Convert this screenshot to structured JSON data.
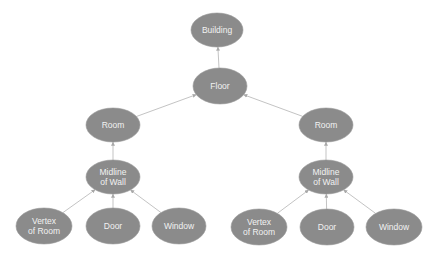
{
  "diagram": {
    "type": "hierarchy tree",
    "colors": {
      "node_fill": "#8b8b8b",
      "node_text": "#f2f2f2",
      "edge": "#b4b4b4",
      "background": "#ffffff"
    },
    "nodes": [
      {
        "id": "building",
        "lines": [
          "Building"
        ],
        "cx": 217,
        "cy": 30,
        "rx": 26,
        "ry": 17
      },
      {
        "id": "floor",
        "lines": [
          "Floor"
        ],
        "cx": 220,
        "cy": 86,
        "rx": 27,
        "ry": 18
      },
      {
        "id": "room_left",
        "lines": [
          "Room"
        ],
        "cx": 113,
        "cy": 125,
        "rx": 27,
        "ry": 17
      },
      {
        "id": "room_right",
        "lines": [
          "Room"
        ],
        "cx": 326,
        "cy": 125,
        "rx": 27,
        "ry": 17
      },
      {
        "id": "midline_left",
        "lines": [
          "Midline",
          "of Wall"
        ],
        "cx": 113,
        "cy": 177,
        "rx": 27,
        "ry": 17
      },
      {
        "id": "midline_right",
        "lines": [
          "Midline",
          "of Wall"
        ],
        "cx": 326,
        "cy": 177,
        "rx": 27,
        "ry": 17
      },
      {
        "id": "vertex_left",
        "lines": [
          "Vertex",
          "of Room"
        ],
        "cx": 44,
        "cy": 226,
        "rx": 28,
        "ry": 18
      },
      {
        "id": "door_left",
        "lines": [
          "Door"
        ],
        "cx": 113,
        "cy": 226,
        "rx": 27,
        "ry": 18
      },
      {
        "id": "window_left",
        "lines": [
          "Window"
        ],
        "cx": 179,
        "cy": 226,
        "rx": 27,
        "ry": 18
      },
      {
        "id": "vertex_right",
        "lines": [
          "Vertex",
          "of Room"
        ],
        "cx": 259,
        "cy": 227,
        "rx": 28,
        "ry": 18
      },
      {
        "id": "door_right",
        "lines": [
          "Door"
        ],
        "cx": 327,
        "cy": 227,
        "rx": 27,
        "ry": 18
      },
      {
        "id": "window_right",
        "lines": [
          "Window"
        ],
        "cx": 394,
        "cy": 227,
        "rx": 28,
        "ry": 18
      }
    ],
    "edges": [
      {
        "from": "floor",
        "to": "building"
      },
      {
        "from": "room_left",
        "to": "floor"
      },
      {
        "from": "room_right",
        "to": "floor"
      },
      {
        "from": "midline_left",
        "to": "room_left"
      },
      {
        "from": "midline_right",
        "to": "room_right"
      },
      {
        "from": "vertex_left",
        "to": "midline_left"
      },
      {
        "from": "door_left",
        "to": "midline_left"
      },
      {
        "from": "window_left",
        "to": "midline_left"
      },
      {
        "from": "vertex_right",
        "to": "midline_right"
      },
      {
        "from": "door_right",
        "to": "midline_right"
      },
      {
        "from": "window_right",
        "to": "midline_right"
      }
    ]
  }
}
